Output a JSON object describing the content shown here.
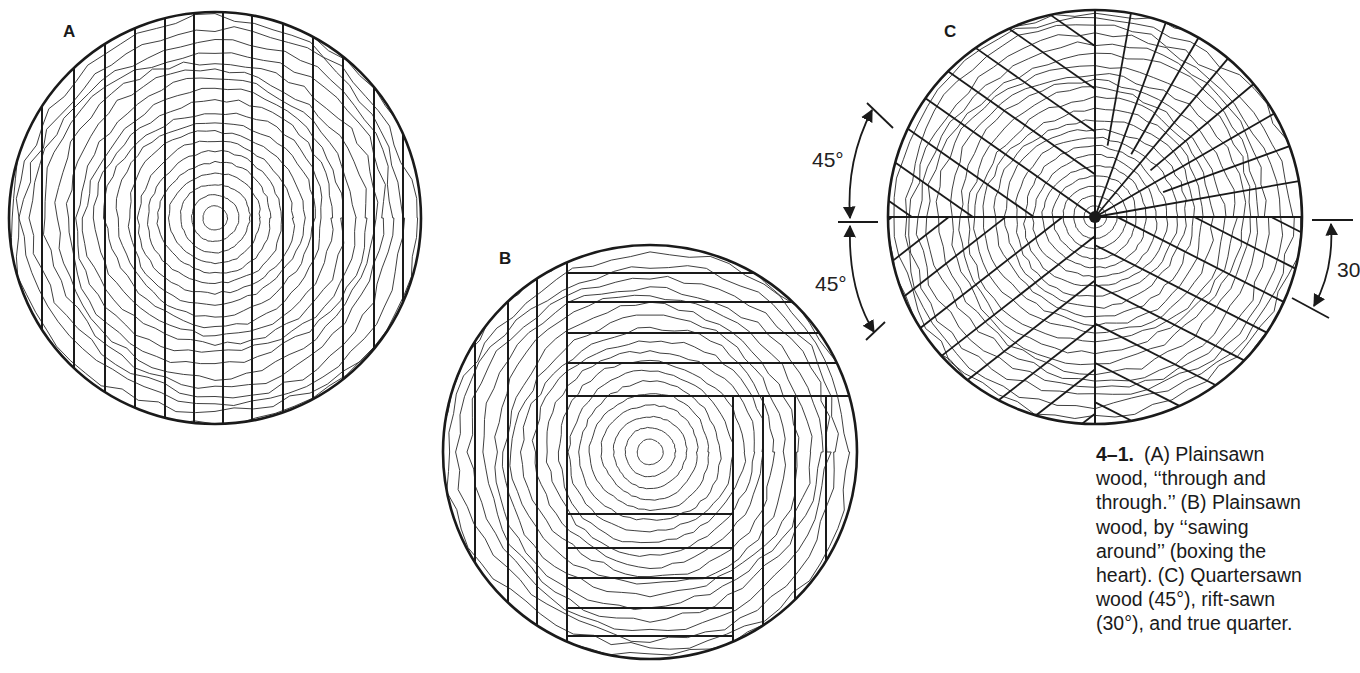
{
  "figure": {
    "number": "4–1.",
    "caption_lines": [
      "(A) Plainsawn",
      "wood, ‘‘through and",
      "through.’’ (B) Plainsawn",
      "wood, by ‘‘sawing",
      "around’’ (boxing the",
      "heart). (C) Quartersawn",
      "wood (45°), rift-sawn",
      "(30°), and true quarter."
    ]
  },
  "panels": {
    "A": {
      "label": "A",
      "title": "Plainsawn, through and through",
      "center": [
        215,
        218
      ],
      "radius": 206,
      "ring_count": 20,
      "cut_lines_x": [
        42,
        74,
        105,
        135,
        165,
        194,
        223,
        252,
        283,
        313,
        343,
        374,
        403
      ]
    },
    "B": {
      "label": "B",
      "title": "Plainsawn, sawing around (boxing the heart)",
      "center": [
        650,
        452
      ],
      "radius": 207,
      "ring_count": 19,
      "left_verticals_x": [
        475,
        508,
        537
      ],
      "box": {
        "left": 567,
        "right": 733,
        "top": 396
      },
      "top_horizontals_y": [
        273,
        302,
        333,
        363
      ],
      "top_bottom_edge_y": 396,
      "right_verticals_x": [
        763,
        795,
        826
      ],
      "bottom_horizontals_y": [
        514,
        548,
        578,
        608,
        636
      ]
    },
    "C": {
      "label": "C",
      "title": "Quartersawn (45°), rift-sawn (30°), and true quarter",
      "center": [
        1095,
        217
      ],
      "radius": 207,
      "ring_count": 22,
      "true_quarter_angles_deg": [
        10,
        20,
        30,
        40,
        50,
        60,
        70,
        80
      ],
      "quartersawn_upper_left_offsets": [
        -175,
        -140,
        -105,
        -70,
        -35,
        0,
        35,
        70,
        105,
        140
      ],
      "quartersawn_lower_left_offsets": [
        -160,
        -125,
        -90,
        -55,
        -20,
        15,
        50,
        85,
        120,
        155
      ],
      "riftsawn_lower_right_offsets": [
        -150,
        -115,
        -80,
        -45,
        -10,
        25,
        60,
        95,
        130,
        165
      ],
      "dimensions": [
        {
          "label": "45°",
          "position": "upper-left"
        },
        {
          "label": "45°",
          "position": "lower-left"
        },
        {
          "label": "30",
          "position": "right"
        }
      ]
    }
  },
  "colors": {
    "ink": "#1a1a1a",
    "ring": "#2b2b2b",
    "paper": "#ffffff"
  }
}
